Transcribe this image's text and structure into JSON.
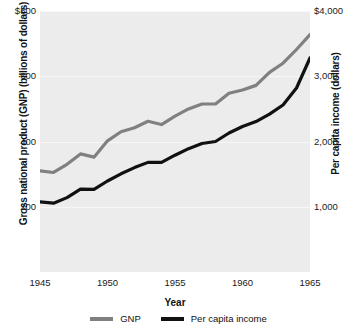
{
  "chart_data": {
    "type": "line",
    "title": "",
    "xlabel": "Year",
    "ylabel": "Gross national product (GNP) (billions of dollars)",
    "y2label": "Per capita income (dollars)",
    "x": [
      1945,
      1946,
      1947,
      1948,
      1949,
      1950,
      1951,
      1952,
      1953,
      1954,
      1955,
      1956,
      1957,
      1958,
      1959,
      1960,
      1961,
      1962,
      1963,
      1964,
      1965
    ],
    "xlim": [
      1945,
      1965
    ],
    "xticks": [
      "1945",
      "1950",
      "1955",
      "1960",
      "1965"
    ],
    "xtick_values": [
      1945,
      1950,
      1955,
      1960,
      1965
    ],
    "ylim": [
      0,
      800
    ],
    "yticks": [
      "$800",
      "600",
      "400",
      "200"
    ],
    "ytick_values": [
      800,
      600,
      400,
      200
    ],
    "y2lim": [
      0,
      4000
    ],
    "y2ticks": [
      "$4,000",
      "3,000",
      "2,000",
      "1,000"
    ],
    "y2tick_values": [
      4000,
      3000,
      2000,
      1000
    ],
    "grid": true,
    "legend_position": "bottom",
    "plot_background": "#ececec",
    "series": [
      {
        "name": "GNP",
        "axis": "left",
        "color": "#808080",
        "units": "billions of dollars",
        "values": [
          310,
          305,
          330,
          362,
          352,
          402,
          430,
          442,
          462,
          452,
          478,
          500,
          515,
          515,
          548,
          558,
          572,
          612,
          640,
          682,
          728
        ]
      },
      {
        "name": "Per capita income",
        "axis": "right",
        "color": "#111111",
        "units": "dollars",
        "values": [
          1075,
          1055,
          1140,
          1270,
          1265,
          1395,
          1505,
          1600,
          1680,
          1680,
          1790,
          1890,
          1970,
          2000,
          2130,
          2230,
          2305,
          2420,
          2560,
          2820,
          3280
        ]
      }
    ]
  },
  "legend": {
    "items": [
      {
        "label": "GNP",
        "color": "#808080"
      },
      {
        "label": "Per capita income",
        "color": "#111111"
      }
    ]
  }
}
